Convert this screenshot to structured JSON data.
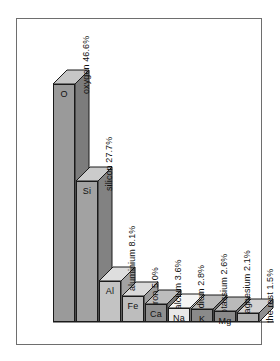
{
  "chart_data": {
    "type": "bar",
    "title": "",
    "subtitle": "",
    "xlabel": "",
    "ylabel": "",
    "ylim": [
      0,
      46.6
    ],
    "grid": false,
    "legend": "none",
    "style": "3d-isometric-column",
    "unit": "%",
    "categories": [
      "oxygen",
      "silicon",
      "aluminium",
      "iron",
      "calcium",
      "sodium",
      "potassium",
      "magnesium",
      "the rest"
    ],
    "symbols": [
      "O",
      "Si",
      "Al",
      "Fe",
      "Ca",
      "Na",
      "K",
      "Mg",
      ""
    ],
    "values": [
      46.6,
      27.7,
      8.1,
      5.0,
      3.6,
      2.8,
      2.6,
      2.1,
      1.5
    ],
    "labels": [
      "oxygen 46.6%",
      "silicon 27.7%",
      "aluminium 8.1%",
      "iron 5.0%",
      "calcium 3.6%",
      "sodium 2.8%",
      "potassium 2.6%",
      "magnesium 2.1%",
      "the rest 1.5%"
    ],
    "bar_colors": [
      "#9a9a9a",
      "#a2a2a2",
      "#c3c3c3",
      "#bdbdbd",
      "#8f8f8f",
      "#e8e8e8",
      "#8a8a8a",
      "#8a8a8a",
      "#b0b0b0"
    ],
    "top_colors": [
      "#c6c6c6",
      "#cbcbcb",
      "#dedede",
      "#dadada",
      "#bdbdbd",
      "#f4f4f4",
      "#bababa",
      "#bababa",
      "#d2d2d2"
    ],
    "side_colors": [
      "#7c7c7c",
      "#828282",
      "#a2a2a2",
      "#9c9c9c",
      "#737373",
      "#c4c4c4",
      "#6f6f6f",
      "#6f6f6f",
      "#8f8f8f"
    ]
  },
  "figure": {
    "frame_color": "#6e6e6e",
    "background": "#ffffff",
    "outline_color": "#1a1a1a"
  }
}
